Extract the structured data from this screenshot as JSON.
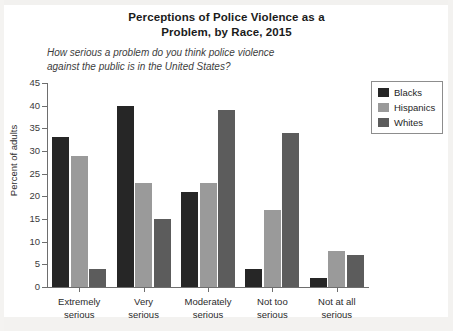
{
  "chart_data": {
    "type": "bar",
    "title": "Perceptions of Police Violence as a Problem, by Race, 2015",
    "title_line1": "Perceptions of Police Violence as a",
    "title_line2": "Problem, by Race, 2015",
    "subtitle": "How serious a problem do you think police violence against the public is in the United States?",
    "subtitle_line1": "How serious a problem do you think police violence",
    "subtitle_line2": "against the public is in the United States?",
    "xlabel": "",
    "ylabel": "Percent of adults",
    "ylim": [
      0,
      45
    ],
    "ytick_step": 5,
    "yticks": [
      0,
      5,
      10,
      15,
      20,
      25,
      30,
      35,
      40,
      45
    ],
    "ytick_labels": [
      "0",
      "5",
      "10",
      "15",
      "20",
      "25",
      "30",
      "35",
      "40",
      "45"
    ],
    "grid": false,
    "legend_position": "top-right",
    "categories": [
      "Extremely serious",
      "Very serious",
      "Moderately serious",
      "Not too serious",
      "Not at all serious"
    ],
    "category_lines": [
      [
        "Extremely",
        "serious"
      ],
      [
        "Very",
        "serious"
      ],
      [
        "Moderately",
        "serious"
      ],
      [
        "Not too",
        "serious"
      ],
      [
        "Not at all",
        "serious"
      ]
    ],
    "series": [
      {
        "name": "Blacks",
        "color": "#262626",
        "values": [
          33,
          40,
          21,
          4,
          2
        ]
      },
      {
        "name": "Hispanics",
        "color": "#9a9a9a",
        "values": [
          29,
          23,
          23,
          17,
          8
        ]
      },
      {
        "name": "Whites",
        "color": "#5c5c5c",
        "values": [
          4,
          15,
          39,
          34,
          7
        ]
      }
    ]
  },
  "legend": {
    "items": [
      {
        "label": "Blacks",
        "color": "#262626"
      },
      {
        "label": "Hispanics",
        "color": "#9a9a9a"
      },
      {
        "label": "Whites",
        "color": "#5c5c5c"
      }
    ]
  }
}
